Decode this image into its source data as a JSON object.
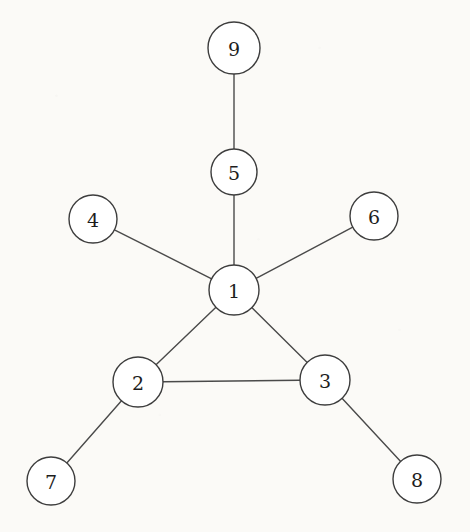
{
  "diagram": {
    "type": "undirected-graph",
    "background_color": "#fbfaf7",
    "node_fill_color": "#ffffff",
    "node_stroke_color": "#3d3d3d",
    "edge_color": "#4a4a4a",
    "label_color": "#1d1d1d",
    "nodes": [
      {
        "id": "1",
        "label": "1",
        "x": 234,
        "y": 290,
        "r": 25
      },
      {
        "id": "2",
        "label": "2",
        "x": 138,
        "y": 382,
        "r": 25
      },
      {
        "id": "3",
        "label": "3",
        "x": 325,
        "y": 380,
        "r": 25
      },
      {
        "id": "4",
        "label": "4",
        "x": 93,
        "y": 219,
        "r": 24
      },
      {
        "id": "5",
        "label": "5",
        "x": 234,
        "y": 172,
        "r": 23
      },
      {
        "id": "6",
        "label": "6",
        "x": 374,
        "y": 216,
        "r": 24
      },
      {
        "id": "7",
        "label": "7",
        "x": 51,
        "y": 481,
        "r": 24
      },
      {
        "id": "8",
        "label": "8",
        "x": 417,
        "y": 479,
        "r": 24
      },
      {
        "id": "9",
        "label": "9",
        "x": 234,
        "y": 48,
        "r": 26
      }
    ],
    "edges": [
      {
        "source": "9",
        "target": "5"
      },
      {
        "source": "5",
        "target": "1"
      },
      {
        "source": "4",
        "target": "1"
      },
      {
        "source": "6",
        "target": "1"
      },
      {
        "source": "1",
        "target": "2"
      },
      {
        "source": "1",
        "target": "3"
      },
      {
        "source": "2",
        "target": "3"
      },
      {
        "source": "2",
        "target": "7"
      },
      {
        "source": "3",
        "target": "8"
      }
    ]
  }
}
